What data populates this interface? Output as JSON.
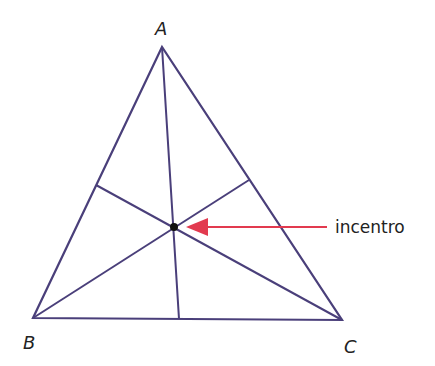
{
  "diagram": {
    "colors": {
      "line": "#4a3f7a",
      "arrow": "#e23a4f",
      "point": "#111111",
      "text": "#222222"
    },
    "vertices": [
      {
        "label": "A",
        "x": 162,
        "y": 47,
        "label_x": 155,
        "label_y": 33
      },
      {
        "label": "B",
        "x": 33,
        "y": 318,
        "label_x": 24,
        "label_y": 348
      },
      {
        "label": "C",
        "x": 342,
        "y": 320,
        "label_x": 344,
        "label_y": 352
      }
    ],
    "incenter": {
      "x": 174,
      "y": 227
    },
    "bisector_feet": [
      {
        "from": "A",
        "x": 179,
        "y": 319
      },
      {
        "from": "B",
        "x": 249,
        "y": 180
      },
      {
        "from": "C",
        "x": 96,
        "y": 185
      }
    ],
    "annotation": {
      "label": "incentro",
      "arrow_from_x": 327,
      "arrow_to_x": 186,
      "y": 227
    }
  }
}
